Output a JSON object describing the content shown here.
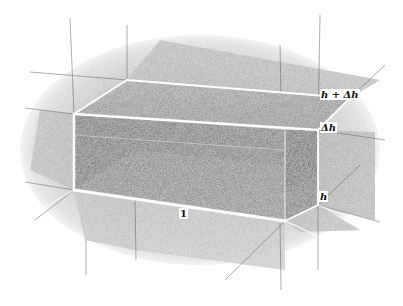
{
  "figure": {
    "labels": {
      "top_height": "h + Δh",
      "increment": "Δh",
      "height": "h",
      "base_length": "1"
    },
    "colors": {
      "background": "#ffffff",
      "grid_light": "#c8c8c8",
      "grid_mid": "#9a9a9a",
      "box_dark": "#5a5a5a",
      "box_darker": "#444444",
      "edge_highlight": "#ffffff",
      "label_text": "#111111"
    }
  }
}
